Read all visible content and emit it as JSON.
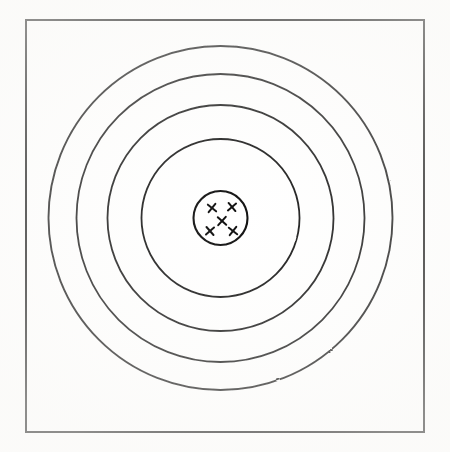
{
  "figure": {
    "caption_clipped": "Figure",
    "kind": "target-diagram",
    "background_color": "#ffffff",
    "ink_color": "#111111"
  },
  "frame": {
    "name": "target-frame",
    "x": 26,
    "y": 20,
    "width": 398,
    "height": 412,
    "stroke_width": 2.0
  },
  "target": {
    "center_x": 220.5,
    "center_y": 218,
    "ring_count": 5,
    "rings": [
      {
        "label": "ring-1-outer",
        "radius": 172,
        "stroke_width": 1.9
      },
      {
        "label": "ring-2",
        "radius": 144,
        "stroke_width": 1.8
      },
      {
        "label": "ring-3",
        "radius": 113,
        "stroke_width": 1.8
      },
      {
        "label": "ring-4",
        "radius": 79,
        "stroke_width": 1.8
      },
      {
        "label": "ring-5-bullseye",
        "radius": 27,
        "stroke_width": 2.1
      }
    ]
  },
  "shots": {
    "name": "shot-marks",
    "count": 5,
    "glyph": "X",
    "marks": [
      {
        "label": "shot-top-left",
        "x": 212,
        "y": 208,
        "size": 7.5,
        "rotation": -6
      },
      {
        "label": "shot-top-right",
        "x": 232,
        "y": 207,
        "size": 7.5,
        "rotation": 5
      },
      {
        "label": "shot-center",
        "x": 222,
        "y": 221,
        "size": 8.0,
        "rotation": -3
      },
      {
        "label": "shot-bottom-left",
        "x": 210,
        "y": 231,
        "size": 7.5,
        "rotation": 4
      },
      {
        "label": "shot-bottom-right",
        "x": 233,
        "y": 231,
        "size": 7.5,
        "rotation": -7
      }
    ]
  },
  "chart_data": {
    "type": "scatter",
    "title": "",
    "xlabel": "",
    "ylabel": "",
    "rings_radii": [
      172,
      144,
      113,
      79,
      27
    ],
    "ring_labels": [
      "ring-1-outer",
      "ring-2",
      "ring-3",
      "ring-4",
      "ring-5-bullseye"
    ],
    "center": [
      220.5,
      218
    ],
    "points": [
      {
        "x": 212,
        "y": 208
      },
      {
        "x": 232,
        "y": 207
      },
      {
        "x": 222,
        "y": 221
      },
      {
        "x": 210,
        "y": 231
      },
      {
        "x": 233,
        "y": 231
      }
    ],
    "point_marker": "x",
    "grid": false,
    "legend": "none"
  }
}
